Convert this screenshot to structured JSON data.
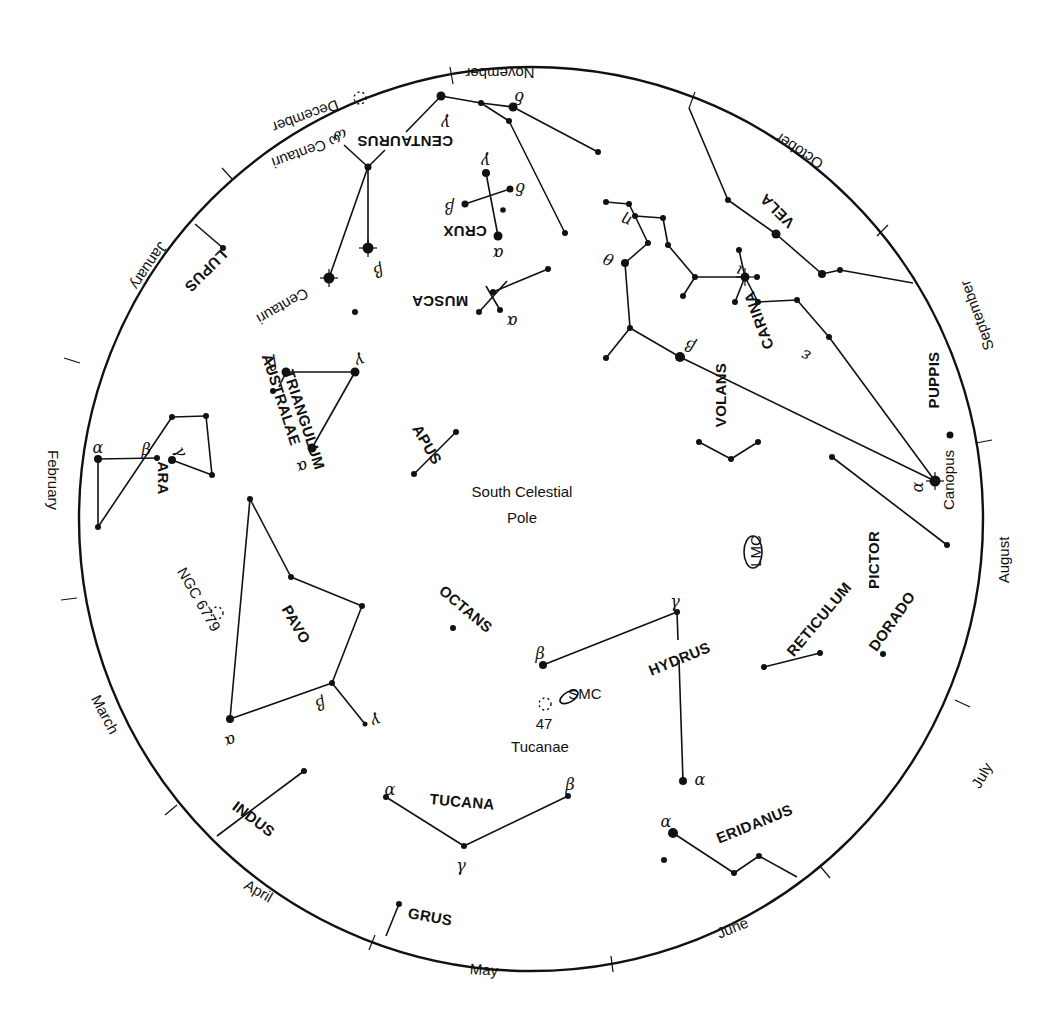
{
  "title": "South Celestial Pole",
  "circle": {
    "cx": 531,
    "cy": 519,
    "r": 452
  },
  "center_label": {
    "line1": "South Celestial",
    "line2": "Pole",
    "x": 522,
    "y": 497
  },
  "months": [
    {
      "name": "November",
      "x": 500,
      "y": 72,
      "rot": 180
    },
    {
      "name": "October",
      "x": 800,
      "y": 150,
      "rot": 213
    },
    {
      "name": "September",
      "x": 978,
      "y": 315,
      "rot": 250
    },
    {
      "name": "August",
      "x": 1005,
      "y": 560,
      "rot": 270
    },
    {
      "name": "July",
      "x": 983,
      "y": 776,
      "rot": 300
    },
    {
      "name": "June",
      "x": 733,
      "y": 929,
      "rot": -22
    },
    {
      "name": "May",
      "x": 484,
      "y": 971,
      "rot": 4
    },
    {
      "name": "April",
      "x": 258,
      "y": 892,
      "rot": 30
    },
    {
      "name": "March",
      "x": 104,
      "y": 715,
      "rot": 62
    },
    {
      "name": "February",
      "x": 52,
      "y": 480,
      "rot": 90
    },
    {
      "name": "January",
      "x": 148,
      "y": 265,
      "rot": 124
    },
    {
      "name": "December",
      "x": 305,
      "y": 115,
      "rot": 160
    }
  ],
  "ticks": [
    {
      "x1": 453,
      "y1": 84,
      "x2": 450,
      "y2": 67
    },
    {
      "x1": 689,
      "y1": 108,
      "x2": 695,
      "y2": 92
    },
    {
      "x1": 877,
      "y1": 236,
      "x2": 888,
      "y2": 225
    },
    {
      "x1": 976,
      "y1": 443,
      "x2": 992,
      "y2": 440
    },
    {
      "x1": 955,
      "y1": 700,
      "x2": 970,
      "y2": 707
    },
    {
      "x1": 820,
      "y1": 866,
      "x2": 830,
      "y2": 878
    },
    {
      "x1": 611,
      "y1": 956,
      "x2": 613,
      "y2": 972
    },
    {
      "x1": 375,
      "y1": 935,
      "x2": 369,
      "y2": 950
    },
    {
      "x1": 177,
      "y1": 805,
      "x2": 165,
      "y2": 815
    },
    {
      "x1": 77,
      "y1": 598,
      "x2": 61,
      "y2": 600
    },
    {
      "x1": 80,
      "y1": 363,
      "x2": 64,
      "y2": 358
    },
    {
      "x1": 233,
      "y1": 180,
      "x2": 222,
      "y2": 168
    }
  ],
  "constellations": [
    {
      "name": "CENTAURUS",
      "label_x": 405,
      "label_y": 140,
      "rot": 180
    },
    {
      "name": "CRUX",
      "label_x": 465,
      "label_y": 230,
      "rot": 180
    },
    {
      "name": "MUSCA",
      "label_x": 440,
      "label_y": 300,
      "rot": 180
    },
    {
      "name": "LUPUS",
      "label_x": 205,
      "label_y": 270,
      "rot": 135
    },
    {
      "name": "VELA",
      "label_x": 778,
      "label_y": 210,
      "rot": 225
    },
    {
      "name": "CARINA",
      "label_x": 760,
      "label_y": 320,
      "rot": 250
    },
    {
      "name": "PUPPIS",
      "label_x": 935,
      "label_y": 380,
      "rot": 270
    },
    {
      "name": "VOLANS",
      "label_x": 722,
      "label_y": 395,
      "rot": 270
    },
    {
      "name": "TRIANGULUM",
      "label_x": 303,
      "label_y": 420,
      "rot": 72
    },
    {
      "name": "AUSTRALAE",
      "label_x": 280,
      "label_y": 400,
      "rot": 72
    },
    {
      "name": "APUS",
      "label_x": 426,
      "label_y": 445,
      "rot": 60
    },
    {
      "name": "ARA",
      "label_x": 162,
      "label_y": 478,
      "rot": 90
    },
    {
      "name": "PAVO",
      "label_x": 295,
      "label_y": 625,
      "rot": 60
    },
    {
      "name": "OCTANS",
      "label_x": 465,
      "label_y": 610,
      "rot": 40
    },
    {
      "name": "HYDRUS",
      "label_x": 680,
      "label_y": 660,
      "rot": -22
    },
    {
      "name": "RETICULUM",
      "label_x": 820,
      "label_y": 620,
      "rot": -50
    },
    {
      "name": "PICTOR",
      "label_x": 875,
      "label_y": 560,
      "rot": -90
    },
    {
      "name": "DORADO",
      "label_x": 893,
      "label_y": 622,
      "rot": -55
    },
    {
      "name": "TUCANA",
      "label_x": 462,
      "label_y": 803,
      "rot": 5
    },
    {
      "name": "INDUS",
      "label_x": 253,
      "label_y": 820,
      "rot": 37
    },
    {
      "name": "GRUS",
      "label_x": 430,
      "label_y": 918,
      "rot": 10
    },
    {
      "name": "ERIDANUS",
      "label_x": 755,
      "label_y": 825,
      "rot": -22
    }
  ],
  "objects": [
    {
      "name": "LMC",
      "x": 757,
      "y": 551,
      "rot": -90,
      "ellipse": {
        "cx": 753,
        "cy": 552,
        "rx": 9,
        "ry": 16,
        "rot": 0
      }
    },
    {
      "name": "SMC",
      "x": 585,
      "y": 695,
      "rot": 0,
      "ellipse": {
        "cx": 569,
        "cy": 697,
        "rx": 10,
        "ry": 5,
        "rot": -30
      }
    },
    {
      "name": "47",
      "x": 544,
      "y": 725,
      "rot": 0
    },
    {
      "name": "Tucanae",
      "x": 540,
      "y": 748,
      "rot": 0
    },
    {
      "name": "NGC 6779",
      "x": 198,
      "y": 600,
      "rot": 60
    },
    {
      "name": "Canopus",
      "x": 950,
      "y": 480,
      "rot": -90
    },
    {
      "name": "ω Centauri",
      "x": 306,
      "y": 150,
      "rot": 160
    },
    {
      "name": "Centauri",
      "x": 282,
      "y": 305,
      "rot": 150
    }
  ],
  "clusters": [
    {
      "name": "omega-centauri-cluster",
      "x": 360,
      "y": 98
    },
    {
      "name": "ngc-6779-cluster",
      "x": 217,
      "y": 613
    },
    {
      "name": "47-tucanae-cluster",
      "x": 545,
      "y": 704
    }
  ],
  "stars": [
    [
      441,
      96,
      4.5
    ],
    [
      481,
      103,
      3
    ],
    [
      513,
      107,
      4.5
    ],
    [
      509,
      121,
      3
    ],
    [
      598,
      152,
      3
    ],
    [
      368,
      167,
      3.5
    ],
    [
      368,
      248,
      5.5
    ],
    [
      329,
      278,
      5.5
    ],
    [
      355,
      312,
      3
    ],
    [
      486,
      173,
      4
    ],
    [
      510,
      189,
      3.5
    ],
    [
      465,
      204,
      3.5
    ],
    [
      503,
      210,
      2.8
    ],
    [
      498,
      236,
      4.5
    ],
    [
      565,
      233,
      3
    ],
    [
      548,
      269,
      3
    ],
    [
      493,
      292,
      3
    ],
    [
      479,
      312,
      3
    ],
    [
      500,
      310,
      3
    ],
    [
      223,
      248,
      3
    ],
    [
      606,
      202,
      3
    ],
    [
      629,
      204,
      3
    ],
    [
      635,
      216,
      3
    ],
    [
      663,
      218,
      3
    ],
    [
      648,
      243,
      3
    ],
    [
      668,
      245,
      3
    ],
    [
      625,
      263,
      4
    ],
    [
      695,
      277,
      3
    ],
    [
      683,
      296,
      3
    ],
    [
      745,
      277,
      4.5
    ],
    [
      757,
      277,
      3
    ],
    [
      739,
      250,
      3
    ],
    [
      735,
      302,
      3
    ],
    [
      758,
      302,
      3
    ],
    [
      797,
      300,
      3
    ],
    [
      606,
      358,
      3
    ],
    [
      630,
      328,
      3
    ],
    [
      680,
      357,
      5
    ],
    [
      829,
      337,
      3
    ],
    [
      776,
      234,
      4.5
    ],
    [
      728,
      200,
      3
    ],
    [
      822,
      274,
      4
    ],
    [
      840,
      270,
      3
    ],
    [
      950,
      435,
      3.5
    ],
    [
      935,
      481,
      5.5
    ],
    [
      832,
      457,
      3
    ],
    [
      947,
      545,
      3
    ],
    [
      699,
      442,
      3
    ],
    [
      731,
      459,
      3
    ],
    [
      758,
      442,
      3
    ],
    [
      286,
      372,
      4.5
    ],
    [
      355,
      372,
      4.5
    ],
    [
      273,
      391,
      3
    ],
    [
      312,
      448,
      4.5
    ],
    [
      456,
      432,
      3
    ],
    [
      414,
      474,
      3
    ],
    [
      172,
      417,
      3
    ],
    [
      206,
      416,
      3
    ],
    [
      98,
      459,
      4
    ],
    [
      157,
      458,
      3
    ],
    [
      172,
      460,
      4
    ],
    [
      212,
      475,
      3
    ],
    [
      98,
      527,
      3
    ],
    [
      250,
      499,
      3
    ],
    [
      291,
      577,
      3
    ],
    [
      362,
      606,
      3
    ],
    [
      332,
      683,
      3
    ],
    [
      230,
      719,
      4
    ],
    [
      365,
      724,
      2.5
    ],
    [
      453,
      628,
      3
    ],
    [
      543,
      665,
      4
    ],
    [
      677,
      612,
      3
    ],
    [
      683,
      781,
      4
    ],
    [
      764,
      667,
      3
    ],
    [
      820,
      653,
      3
    ],
    [
      883,
      654,
      3
    ],
    [
      304,
      771,
      3
    ],
    [
      386,
      797,
      3
    ],
    [
      568,
      796,
      3
    ],
    [
      464,
      846,
      3
    ],
    [
      399,
      904,
      3
    ],
    [
      673,
      833,
      5
    ],
    [
      664,
      860,
      3
    ],
    [
      734,
      873,
      3
    ],
    [
      759,
      856,
      3
    ]
  ],
  "bright_stars": [
    {
      "name": "beta-centauri",
      "x": 368,
      "y": 248
    },
    {
      "name": "alpha-centauri",
      "x": 329,
      "y": 278
    },
    {
      "name": "canopus",
      "x": 935,
      "y": 481
    },
    {
      "name": "iota-carinae",
      "x": 745,
      "y": 277
    }
  ],
  "lines": [
    [
      441,
      96,
      481,
      103
    ],
    [
      481,
      103,
      513,
      107
    ],
    [
      481,
      103,
      509,
      121
    ],
    [
      513,
      107,
      598,
      152
    ],
    [
      509,
      121,
      565,
      233
    ],
    [
      441,
      96,
      406,
      132
    ],
    [
      385,
      150,
      368,
      167
    ],
    [
      368,
      167,
      344,
      145
    ],
    [
      368,
      167,
      368,
      248
    ],
    [
      368,
      167,
      329,
      278
    ],
    [
      486,
      173,
      498,
      236
    ],
    [
      465,
      204,
      510,
      189
    ],
    [
      493,
      292,
      548,
      269
    ],
    [
      479,
      312,
      507,
      281
    ],
    [
      500,
      310,
      486,
      286
    ],
    [
      195,
      224,
      223,
      248
    ],
    [
      606,
      202,
      629,
      204
    ],
    [
      635,
      216,
      663,
      218
    ],
    [
      629,
      204,
      635,
      216
    ],
    [
      635,
      216,
      648,
      243
    ],
    [
      648,
      243,
      625,
      263
    ],
    [
      663,
      218,
      668,
      245
    ],
    [
      668,
      245,
      695,
      277
    ],
    [
      695,
      277,
      683,
      296
    ],
    [
      695,
      277,
      745,
      277
    ],
    [
      745,
      277,
      739,
      250
    ],
    [
      745,
      277,
      735,
      302
    ],
    [
      745,
      277,
      758,
      302
    ],
    [
      758,
      302,
      797,
      300
    ],
    [
      797,
      300,
      829,
      337
    ],
    [
      829,
      337,
      935,
      481
    ],
    [
      625,
      263,
      630,
      328
    ],
    [
      630,
      328,
      606,
      358
    ],
    [
      630,
      328,
      680,
      357
    ],
    [
      680,
      357,
      935,
      481
    ],
    [
      689,
      108,
      728,
      200
    ],
    [
      728,
      200,
      776,
      234
    ],
    [
      776,
      234,
      822,
      274
    ],
    [
      822,
      274,
      840,
      270
    ],
    [
      840,
      270,
      913,
      283
    ],
    [
      832,
      457,
      947,
      545
    ],
    [
      699,
      442,
      731,
      459
    ],
    [
      731,
      459,
      758,
      442
    ],
    [
      286,
      372,
      355,
      372
    ],
    [
      355,
      372,
      312,
      448
    ],
    [
      286,
      372,
      279,
      387
    ],
    [
      456,
      432,
      414,
      474
    ],
    [
      172,
      417,
      206,
      416
    ],
    [
      206,
      416,
      212,
      475
    ],
    [
      212,
      475,
      172,
      460
    ],
    [
      98,
      459,
      157,
      458
    ],
    [
      98,
      459,
      98,
      527
    ],
    [
      98,
      527,
      172,
      417
    ],
    [
      250,
      499,
      291,
      577
    ],
    [
      291,
      577,
      362,
      606
    ],
    [
      362,
      606,
      332,
      683
    ],
    [
      332,
      683,
      230,
      719
    ],
    [
      230,
      719,
      250,
      499
    ],
    [
      332,
      683,
      365,
      724
    ],
    [
      543,
      665,
      677,
      612
    ],
    [
      677,
      612,
      678,
      640
    ],
    [
      679,
      660,
      683,
      781
    ],
    [
      764,
      667,
      820,
      653
    ],
    [
      304,
      771,
      217,
      836
    ],
    [
      386,
      797,
      464,
      846
    ],
    [
      464,
      846,
      568,
      796
    ],
    [
      399,
      904,
      386,
      936
    ],
    [
      673,
      833,
      734,
      873
    ],
    [
      734,
      873,
      759,
      856
    ],
    [
      759,
      856,
      797,
      877
    ]
  ],
  "greek_labels": [
    {
      "t": "γ",
      "x": 446,
      "y": 122,
      "rot": 180
    },
    {
      "t": "δ",
      "x": 519,
      "y": 96,
      "rot": 180
    },
    {
      "t": "ω",
      "x": 340,
      "y": 135,
      "rot": 160
    },
    {
      "t": "γ",
      "x": 486,
      "y": 160,
      "rot": 180
    },
    {
      "t": "δ",
      "x": 520,
      "y": 187,
      "rot": 180
    },
    {
      "t": "β",
      "x": 449,
      "y": 206,
      "rot": 180
    },
    {
      "t": "α",
      "x": 498,
      "y": 252,
      "rot": 180
    },
    {
      "t": "α",
      "x": 512,
      "y": 320,
      "rot": 180
    },
    {
      "t": "β",
      "x": 378,
      "y": 270,
      "rot": 160
    },
    {
      "t": "θ",
      "x": 609,
      "y": 258,
      "rot": 200
    },
    {
      "t": "η",
      "x": 627,
      "y": 220,
      "rot": 200
    },
    {
      "t": "ι",
      "x": 739,
      "y": 270,
      "rot": 200
    },
    {
      "t": "ε",
      "x": 806,
      "y": 355,
      "rot": 200
    },
    {
      "t": "β",
      "x": 690,
      "y": 345,
      "rot": 200
    },
    {
      "t": "α",
      "x": 918,
      "y": 487,
      "rot": -90
    },
    {
      "t": "γ",
      "x": 360,
      "y": 360,
      "rot": 160
    },
    {
      "t": "β",
      "x": 272,
      "y": 363,
      "rot": 160
    },
    {
      "t": "α",
      "x": 302,
      "y": 466,
      "rot": 160
    },
    {
      "t": "α",
      "x": 98,
      "y": 448,
      "rot": 0
    },
    {
      "t": "β",
      "x": 146,
      "y": 450,
      "rot": 0
    },
    {
      "t": "γ",
      "x": 180,
      "y": 452,
      "rot": 60
    },
    {
      "t": "β",
      "x": 320,
      "y": 703,
      "rot": 160
    },
    {
      "t": "γ",
      "x": 376,
      "y": 720,
      "rot": 160
    },
    {
      "t": "α",
      "x": 230,
      "y": 740,
      "rot": 160
    },
    {
      "t": "β",
      "x": 540,
      "y": 654,
      "rot": 0
    },
    {
      "t": "γ",
      "x": 675,
      "y": 602,
      "rot": 0
    },
    {
      "t": "α",
      "x": 700,
      "y": 780,
      "rot": 0
    },
    {
      "t": "α",
      "x": 390,
      "y": 790,
      "rot": 0
    },
    {
      "t": "β",
      "x": 570,
      "y": 785,
      "rot": 0
    },
    {
      "t": "γ",
      "x": 461,
      "y": 866,
      "rot": 0
    },
    {
      "t": "α",
      "x": 666,
      "y": 822,
      "rot": 0
    }
  ]
}
